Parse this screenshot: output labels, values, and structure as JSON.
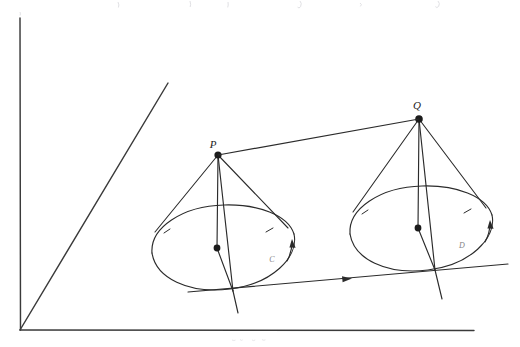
{
  "figure": {
    "caption_visible": false,
    "background_color": "#ffffff",
    "ink_color": "#2b2b2b",
    "axis_color": "#3a3a3a",
    "width": 520,
    "height": 347
  },
  "axes": {
    "origin": {
      "x": 20,
      "y": 330
    },
    "items": [
      {
        "name": "vertical-axis",
        "label": "",
        "x1": 20,
        "y1": 18,
        "x2": 20,
        "y2": 330
      },
      {
        "name": "horizontal-axis",
        "label": "",
        "x1": 20,
        "y1": 330,
        "x2": 474,
        "y2": 330
      },
      {
        "name": "diagonal-axis",
        "label": "",
        "x1": 20,
        "y1": 330,
        "x2": 168,
        "y2": 83
      }
    ]
  },
  "points": [
    {
      "name": "apex-p",
      "label": "P",
      "x": 218,
      "y": 155,
      "label_x": 213,
      "label_y": 148
    },
    {
      "name": "apex-q",
      "label": "Q",
      "x": 419,
      "y": 119,
      "label_x": 417,
      "label_y": 109
    },
    {
      "name": "center-left-ellipse",
      "label": "",
      "x": 217,
      "y": 248
    },
    {
      "name": "center-right-ellipse",
      "label": "",
      "x": 418,
      "y": 228
    }
  ],
  "curve_labels": [
    {
      "name": "left-ellipse-label",
      "label": "C",
      "x": 272,
      "y": 262
    },
    {
      "name": "right-ellipse-label",
      "label": "D",
      "x": 462,
      "y": 248
    }
  ],
  "connectors": [
    {
      "name": "pq-segment",
      "label": "",
      "x1": 218,
      "y1": 155,
      "x2": 419,
      "y2": 119,
      "arrow": false
    },
    {
      "name": "transversal-line",
      "label": "",
      "x1": 188,
      "y1": 292,
      "x2": 508,
      "y2": 264,
      "arrow": true,
      "arrow_x": 345,
      "arrow_y": 280
    }
  ],
  "ellipses": [
    {
      "name": "base-ellipse-left",
      "cx": 222,
      "cy": 247,
      "rx": 72,
      "ry": 42,
      "rotation": -6,
      "arrow_on_right": true
    },
    {
      "name": "base-ellipse-right",
      "cx": 420,
      "cy": 228,
      "rx": 72,
      "ry": 42,
      "rotation": -6,
      "arrow_on_right": true
    }
  ],
  "bleed": {
    "top_text_present": true,
    "bottom_text_present": true,
    "note": "faint cropped text fragments at the extreme top and bottom edges of the scan"
  }
}
